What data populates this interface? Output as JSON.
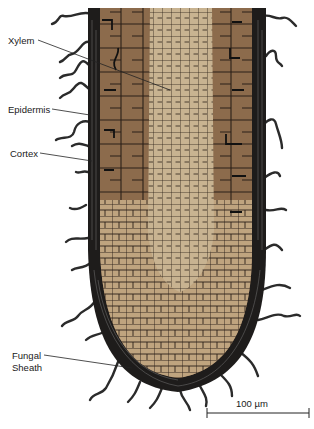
{
  "figure": {
    "colors": {
      "background": "#ffffff",
      "sheath": "#1e1c1b",
      "cortex": "#8c6b4c",
      "cortex_light": "#a4825f",
      "stele": "#c8b391",
      "root_cap": "#bfa47f",
      "cell_wall": "#2a1f17",
      "hypha_fill": "#e8e8e8",
      "leader_line": "#222222"
    }
  },
  "labels": [
    {
      "id": "xylem",
      "text": "Xylem"
    },
    {
      "id": "epidermis",
      "text": "Epidermis"
    },
    {
      "id": "cortex",
      "text": "Cortex"
    },
    {
      "id": "fungal_sheath_line1",
      "text": "Fungal"
    },
    {
      "id": "fungal_sheath_line2",
      "text": "Sheath"
    }
  ],
  "scale_bar": {
    "label": "100 µm",
    "value": 100,
    "unit": "µm"
  }
}
